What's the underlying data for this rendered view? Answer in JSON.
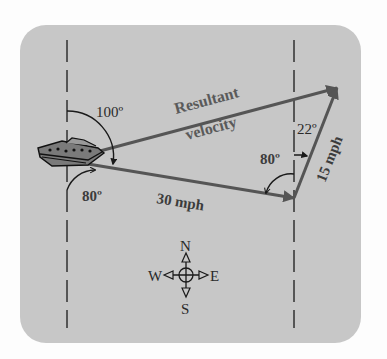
{
  "diagram": {
    "type": "vector-addition",
    "panel_color": "#c7c7c7",
    "vector_color": "#555555",
    "line_color": "#1a1a1a",
    "vectors": {
      "resultant": {
        "label_line1": "Resultant",
        "label_line2": "velocity"
      },
      "boat": {
        "label": "30 mph"
      },
      "current": {
        "label": "15 mph"
      }
    },
    "angles": {
      "boat_top": "100º",
      "boat_bottom": "80º",
      "vertex_inner": "80º",
      "vertex_top": "22º"
    },
    "compass": {
      "north": "N",
      "south": "S",
      "east": "E",
      "west": "W"
    }
  }
}
